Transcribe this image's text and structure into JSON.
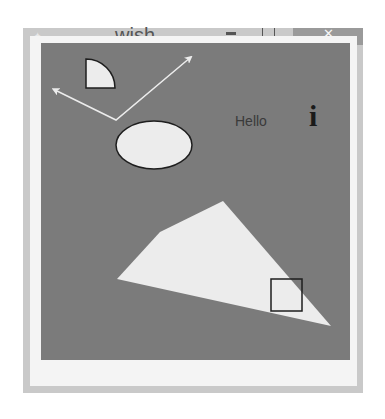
{
  "window": {
    "title": "wish",
    "icon": "tk-feather-icon",
    "controls": {
      "minimize": "minimize-icon",
      "maximize": "maximize-icon",
      "close": "close-icon",
      "close_glyph": "✕"
    }
  },
  "canvas": {
    "background": "#7b7b7b",
    "fill_color": "#ececec",
    "outline_color": "#1e1e1e",
    "text_item": "Hello",
    "bitmap_item": "info",
    "bitmap_glyph": "i",
    "items": [
      {
        "type": "arc",
        "name": "quarter-pie"
      },
      {
        "type": "line",
        "name": "double-arrow-line"
      },
      {
        "type": "oval",
        "name": "ellipse"
      },
      {
        "type": "text",
        "name": "hello-text"
      },
      {
        "type": "bitmap",
        "name": "info-bitmap"
      },
      {
        "type": "polygon",
        "name": "polygon"
      },
      {
        "type": "rectangle",
        "name": "rectangle"
      }
    ]
  }
}
